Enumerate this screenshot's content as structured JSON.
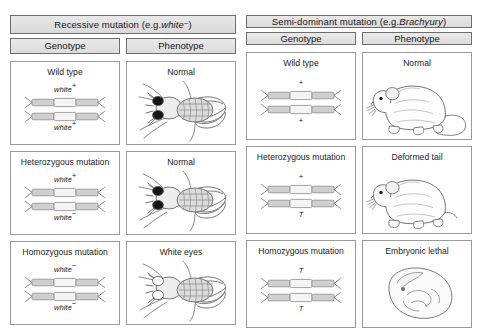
{
  "figure": {
    "panels": [
      {
        "id": "recessive",
        "header_prefix": "Recessive mutation (e.g. ",
        "header_italic": "white",
        "header_sup": "−",
        "header_suffix": ")",
        "columns": [
          {
            "label": "Genotype"
          },
          {
            "label": "Phenotype"
          }
        ],
        "rows": [
          {
            "genotype_title": "Wild type",
            "allele_top": "white",
            "allele_top_sup": "+",
            "allele_bottom": "white",
            "allele_bottom_sup": "+",
            "allele_italic": true,
            "phenotype_title": "Normal",
            "organism": "fly",
            "eyes": "dark"
          },
          {
            "genotype_title": "Heterozygous mutation",
            "allele_top": "white",
            "allele_top_sup": "+",
            "allele_bottom": "white",
            "allele_bottom_sup": "−",
            "allele_italic": true,
            "phenotype_title": "Normal",
            "organism": "fly",
            "eyes": "dark"
          },
          {
            "genotype_title": "Homozygous mutation",
            "allele_top": "white",
            "allele_top_sup": "−",
            "allele_bottom": "white",
            "allele_bottom_sup": "−",
            "allele_italic": true,
            "phenotype_title": "White eyes",
            "organism": "fly",
            "eyes": "white"
          }
        ]
      },
      {
        "id": "semi-dominant",
        "header_prefix": "Semi-dominant mutation (e.g. ",
        "header_italic": "Brachyury",
        "header_sup": "",
        "header_suffix": ")",
        "columns": [
          {
            "label": "Genotype"
          },
          {
            "label": "Phenotype"
          }
        ],
        "rows": [
          {
            "genotype_title": "Wild type",
            "allele_top": "+",
            "allele_top_sup": "",
            "allele_bottom": "+",
            "allele_bottom_sup": "",
            "allele_italic": false,
            "phenotype_title": "Normal",
            "organism": "mouse-long-tail",
            "eyes": "dark"
          },
          {
            "genotype_title": "Heterozygous mutation",
            "allele_top": "+",
            "allele_top_sup": "",
            "allele_bottom": "T",
            "allele_bottom_sup": "",
            "allele_italic": true,
            "phenotype_title": "Deformed tail",
            "organism": "mouse-short-tail",
            "eyes": "dark"
          },
          {
            "genotype_title": "Homozygous mutation",
            "allele_top": "T",
            "allele_top_sup": "",
            "allele_bottom": "T",
            "allele_bottom_sup": "",
            "allele_italic": true,
            "phenotype_title": "Embryonic lethal",
            "organism": "embryo",
            "eyes": "none"
          }
        ]
      }
    ],
    "colors": {
      "background": "#ffffff",
      "header_fill": "#e3e3e3",
      "header_border": "#6d6d6d",
      "cell_border": "#9a9a9a",
      "text": "#16181a",
      "chromosome_fill": "#d2d2d2",
      "chromosome_locus": "#f2f2f2",
      "art_line": "#5d5d5d",
      "eye_dark": "#141414"
    }
  }
}
